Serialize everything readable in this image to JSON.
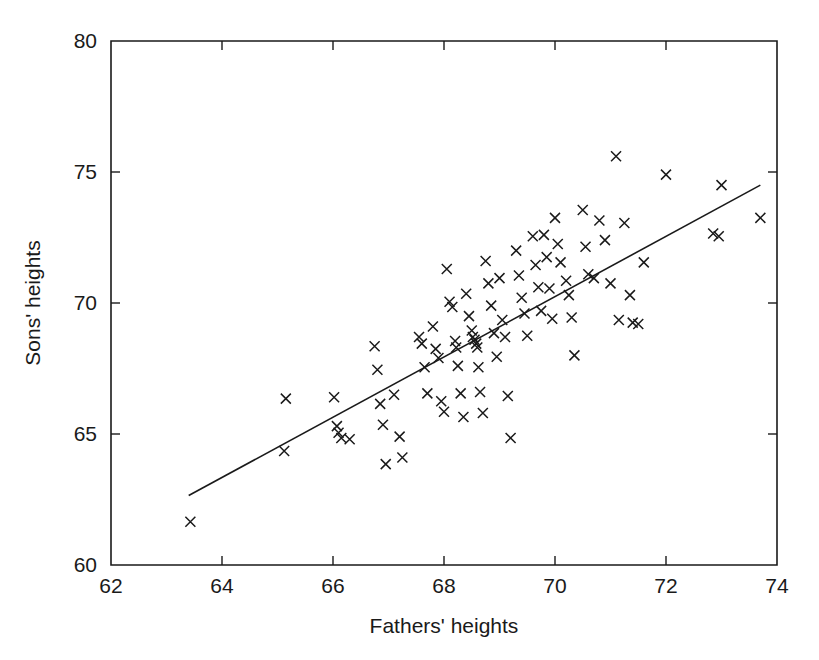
{
  "chart_data": {
    "type": "scatter",
    "title": "",
    "xlabel": "Fathers' heights",
    "ylabel": "Sons' heights",
    "xlim": [
      62,
      74
    ],
    "ylim": [
      60,
      80
    ],
    "xticks": [
      62,
      64,
      66,
      68,
      70,
      72,
      74
    ],
    "yticks": [
      60,
      65,
      70,
      75,
      80
    ],
    "xtick_labels": [
      "62",
      "64",
      "66",
      "68",
      "70",
      "72",
      "74"
    ],
    "ytick_labels": [
      "60",
      "65",
      "70",
      "75",
      "80"
    ],
    "grid": false,
    "legend": null,
    "marker": "x",
    "marker_color": "#1a1a1a",
    "points": [
      [
        63.43,
        61.65
      ],
      [
        65.12,
        64.35
      ],
      [
        65.15,
        66.35
      ],
      [
        66.02,
        66.4
      ],
      [
        66.07,
        65.3
      ],
      [
        66.1,
        65.05
      ],
      [
        66.15,
        64.85
      ],
      [
        66.3,
        64.8
      ],
      [
        66.75,
        68.35
      ],
      [
        66.8,
        67.45
      ],
      [
        66.85,
        66.15
      ],
      [
        66.9,
        65.35
      ],
      [
        66.95,
        63.85
      ],
      [
        67.1,
        66.5
      ],
      [
        67.2,
        64.9
      ],
      [
        67.25,
        64.1
      ],
      [
        67.55,
        68.7
      ],
      [
        67.6,
        68.45
      ],
      [
        67.65,
        67.55
      ],
      [
        67.7,
        66.55
      ],
      [
        67.8,
        69.1
      ],
      [
        67.85,
        68.25
      ],
      [
        67.9,
        67.9
      ],
      [
        67.95,
        66.25
      ],
      [
        68.0,
        65.85
      ],
      [
        68.05,
        71.3
      ],
      [
        68.1,
        70.05
      ],
      [
        68.15,
        69.85
      ],
      [
        68.2,
        68.55
      ],
      [
        68.22,
        68.3
      ],
      [
        68.25,
        67.6
      ],
      [
        68.3,
        66.55
      ],
      [
        68.35,
        65.65
      ],
      [
        68.4,
        70.35
      ],
      [
        68.45,
        69.5
      ],
      [
        68.5,
        68.95
      ],
      [
        68.52,
        68.7
      ],
      [
        68.55,
        68.6
      ],
      [
        68.58,
        68.45
      ],
      [
        68.6,
        68.3
      ],
      [
        68.62,
        67.55
      ],
      [
        68.65,
        66.6
      ],
      [
        68.7,
        65.8
      ],
      [
        68.75,
        71.6
      ],
      [
        68.8,
        70.75
      ],
      [
        68.85,
        69.9
      ],
      [
        68.9,
        68.85
      ],
      [
        68.95,
        67.95
      ],
      [
        69.0,
        70.95
      ],
      [
        69.05,
        69.35
      ],
      [
        69.1,
        68.7
      ],
      [
        69.15,
        66.45
      ],
      [
        69.2,
        64.85
      ],
      [
        69.3,
        72.0
      ],
      [
        69.35,
        71.05
      ],
      [
        69.4,
        70.2
      ],
      [
        69.45,
        69.6
      ],
      [
        69.5,
        68.75
      ],
      [
        69.6,
        72.55
      ],
      [
        69.65,
        71.45
      ],
      [
        69.7,
        70.6
      ],
      [
        69.75,
        69.7
      ],
      [
        69.8,
        72.6
      ],
      [
        69.85,
        71.75
      ],
      [
        69.9,
        70.55
      ],
      [
        69.95,
        69.4
      ],
      [
        70.0,
        73.25
      ],
      [
        70.05,
        72.25
      ],
      [
        70.1,
        71.55
      ],
      [
        70.2,
        70.85
      ],
      [
        70.25,
        70.3
      ],
      [
        70.3,
        69.45
      ],
      [
        70.35,
        68.0
      ],
      [
        70.5,
        73.55
      ],
      [
        70.55,
        72.15
      ],
      [
        70.6,
        71.1
      ],
      [
        70.7,
        70.95
      ],
      [
        70.8,
        73.15
      ],
      [
        70.9,
        72.4
      ],
      [
        71.0,
        70.75
      ],
      [
        71.1,
        75.6
      ],
      [
        71.15,
        69.35
      ],
      [
        71.25,
        73.05
      ],
      [
        71.35,
        70.3
      ],
      [
        71.4,
        69.25
      ],
      [
        71.5,
        69.2
      ],
      [
        71.6,
        71.55
      ],
      [
        72.0,
        74.9
      ],
      [
        72.85,
        72.65
      ],
      [
        72.95,
        72.55
      ],
      [
        73.0,
        74.5
      ],
      [
        73.7,
        73.25
      ]
    ],
    "fit_line": {
      "x": [
        63.4,
        73.7
      ],
      "y": [
        62.65,
        74.5
      ],
      "style": "solid"
    }
  }
}
